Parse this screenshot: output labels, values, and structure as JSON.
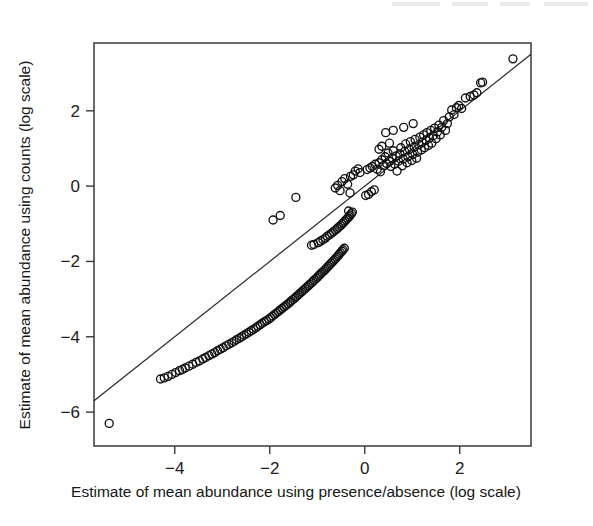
{
  "figure": {
    "background_color": "#ffffff",
    "ink_color": "#111111",
    "frame": {
      "left": 94,
      "top": 43,
      "right": 531,
      "bottom": 446
    }
  },
  "chart_data": {
    "type": "scatter",
    "title": "",
    "xlabel": "Estimate of mean abundance using presence/absence (log scale)",
    "ylabel": "Estimate of mean abundance using counts (log scale)",
    "xticks": [
      -4,
      -2,
      0,
      2
    ],
    "xtick_labels": [
      "-4",
      "-2",
      "0",
      "2"
    ],
    "yticks": [
      2,
      0,
      -2,
      -4,
      -6
    ],
    "ytick_labels": [
      "2",
      "0",
      "-2",
      "-4",
      "-6"
    ],
    "xlim": [
      -5.7,
      3.5
    ],
    "ylim": [
      -6.9,
      3.8
    ],
    "grid": false,
    "legend": null,
    "marker": {
      "shape": "open-circle",
      "radius": 4.0,
      "stroke_width": 1.35
    },
    "reference_line": {
      "name": "identity-line",
      "type": "straight",
      "slope": 1.0,
      "intercept": 0.0,
      "x_from": -5.7,
      "x_to": 3.5,
      "y_from": -5.7,
      "y_to": 3.5
    },
    "series": [
      {
        "name": "species",
        "n_points": 196,
        "points": [
          [
            -5.38,
            -6.3
          ],
          [
            -4.3,
            -5.12
          ],
          [
            -4.22,
            -5.09
          ],
          [
            -4.14,
            -5.05
          ],
          [
            -4.06,
            -5.0
          ],
          [
            -3.98,
            -4.95
          ],
          [
            -3.9,
            -4.9
          ],
          [
            -3.84,
            -4.87
          ],
          [
            -3.78,
            -4.83
          ],
          [
            -3.7,
            -4.78
          ],
          [
            -3.62,
            -4.73
          ],
          [
            -3.55,
            -4.68
          ],
          [
            -3.48,
            -4.64
          ],
          [
            -3.41,
            -4.59
          ],
          [
            -3.35,
            -4.55
          ],
          [
            -3.28,
            -4.5
          ],
          [
            -3.22,
            -4.46
          ],
          [
            -3.16,
            -4.42
          ],
          [
            -3.1,
            -4.37
          ],
          [
            -3.04,
            -4.33
          ],
          [
            -2.98,
            -4.29
          ],
          [
            -2.92,
            -4.24
          ],
          [
            -2.86,
            -4.2
          ],
          [
            -2.8,
            -4.16
          ],
          [
            -2.75,
            -4.12
          ],
          [
            -2.7,
            -4.08
          ],
          [
            -2.64,
            -4.04
          ],
          [
            -2.59,
            -4.0
          ],
          [
            -2.54,
            -3.96
          ],
          [
            -2.49,
            -3.92
          ],
          [
            -2.44,
            -3.88
          ],
          [
            -2.39,
            -3.84
          ],
          [
            -2.34,
            -3.8
          ],
          [
            -2.29,
            -3.76
          ],
          [
            -2.25,
            -3.72
          ],
          [
            -2.2,
            -3.68
          ],
          [
            -2.16,
            -3.64
          ],
          [
            -2.11,
            -3.6
          ],
          [
            -2.07,
            -3.57
          ],
          [
            -2.02,
            -3.53
          ],
          [
            -1.98,
            -3.49
          ],
          [
            -1.94,
            -3.45
          ],
          [
            -1.9,
            -3.41
          ],
          [
            -1.86,
            -3.37
          ],
          [
            -1.82,
            -3.33
          ],
          [
            -1.78,
            -3.29
          ],
          [
            -1.74,
            -3.25
          ],
          [
            -1.7,
            -3.21
          ],
          [
            -1.66,
            -3.17
          ],
          [
            -1.62,
            -3.13
          ],
          [
            -1.58,
            -3.09
          ],
          [
            -1.55,
            -3.05
          ],
          [
            -1.51,
            -3.01
          ],
          [
            -1.47,
            -2.97
          ],
          [
            -1.44,
            -2.93
          ],
          [
            -1.4,
            -2.89
          ],
          [
            -1.37,
            -2.85
          ],
          [
            -1.33,
            -2.81
          ],
          [
            -1.3,
            -2.77
          ],
          [
            -1.26,
            -2.73
          ],
          [
            -1.23,
            -2.69
          ],
          [
            -1.19,
            -2.65
          ],
          [
            -1.16,
            -2.61
          ],
          [
            -1.12,
            -2.57
          ],
          [
            -1.09,
            -2.53
          ],
          [
            -1.06,
            -2.49
          ],
          [
            -1.02,
            -2.45
          ],
          [
            -0.99,
            -2.41
          ],
          [
            -0.96,
            -2.37
          ],
          [
            -0.93,
            -2.33
          ],
          [
            -0.9,
            -2.29
          ],
          [
            -0.86,
            -2.25
          ],
          [
            -0.83,
            -2.21
          ],
          [
            -0.8,
            -2.17
          ],
          [
            -0.77,
            -2.13
          ],
          [
            -0.74,
            -2.09
          ],
          [
            -0.71,
            -2.05
          ],
          [
            -0.68,
            -2.01
          ],
          [
            -0.65,
            -1.97
          ],
          [
            -0.62,
            -1.93
          ],
          [
            -0.59,
            -1.89
          ],
          [
            -0.56,
            -1.85
          ],
          [
            -0.54,
            -1.81
          ],
          [
            -0.51,
            -1.77
          ],
          [
            -0.48,
            -1.73
          ],
          [
            -0.46,
            -1.69
          ],
          [
            -0.43,
            -1.65
          ],
          [
            -1.12,
            -1.57
          ],
          [
            -1.07,
            -1.55
          ],
          [
            -0.98,
            -1.5
          ],
          [
            -0.93,
            -1.46
          ],
          [
            -0.88,
            -1.42
          ],
          [
            -0.83,
            -1.38
          ],
          [
            -0.79,
            -1.33
          ],
          [
            -0.74,
            -1.29
          ],
          [
            -0.7,
            -1.25
          ],
          [
            -0.66,
            -1.21
          ],
          [
            -0.62,
            -1.17
          ],
          [
            -0.58,
            -1.13
          ],
          [
            -0.55,
            -1.09
          ],
          [
            -0.51,
            -1.05
          ],
          [
            -0.48,
            -1.01
          ],
          [
            -0.45,
            -0.97
          ],
          [
            -0.42,
            -0.93
          ],
          [
            -0.39,
            -0.89
          ],
          [
            -0.36,
            -0.85
          ],
          [
            -0.33,
            -0.81
          ],
          [
            -0.31,
            -0.77
          ],
          [
            -0.28,
            -0.73
          ],
          [
            -0.26,
            -0.69
          ],
          [
            -0.34,
            -0.66
          ],
          [
            -1.93,
            -0.9
          ],
          [
            -1.78,
            -0.78
          ],
          [
            -1.45,
            -0.3
          ],
          [
            -0.62,
            -0.05
          ],
          [
            -0.57,
            0.02
          ],
          [
            -0.52,
            -0.12
          ],
          [
            -0.48,
            0.12
          ],
          [
            -0.42,
            0.2
          ],
          [
            -0.36,
            0.05
          ],
          [
            -0.3,
            0.26
          ],
          [
            -0.24,
            0.3
          ],
          [
            -0.2,
            0.4
          ],
          [
            -0.14,
            0.46
          ],
          [
            -0.1,
            0.36
          ],
          [
            -0.31,
            -0.18
          ],
          [
            0.02,
            -0.25
          ],
          [
            0.08,
            -0.22
          ],
          [
            0.14,
            -0.15
          ],
          [
            0.2,
            -0.1
          ],
          [
            0.05,
            0.44
          ],
          [
            0.11,
            0.48
          ],
          [
            0.16,
            0.52
          ],
          [
            0.22,
            0.58
          ],
          [
            0.26,
            0.45
          ],
          [
            0.3,
            0.62
          ],
          [
            0.33,
            0.38
          ],
          [
            0.36,
            0.7
          ],
          [
            0.4,
            0.55
          ],
          [
            0.43,
            0.78
          ],
          [
            0.46,
            0.6
          ],
          [
            0.49,
            0.88
          ],
          [
            0.52,
            0.66
          ],
          [
            0.55,
            0.52
          ],
          [
            0.58,
            0.74
          ],
          [
            0.6,
            0.94
          ],
          [
            0.63,
            0.58
          ],
          [
            0.66,
            0.8
          ],
          [
            0.68,
            0.4
          ],
          [
            0.71,
            0.66
          ],
          [
            0.74,
            0.86
          ],
          [
            0.76,
            1.02
          ],
          [
            0.79,
            0.54
          ],
          [
            0.81,
            0.72
          ],
          [
            0.84,
            0.92
          ],
          [
            0.86,
            1.12
          ],
          [
            0.89,
            0.62
          ],
          [
            0.91,
            0.78
          ],
          [
            0.94,
            0.98
          ],
          [
            0.96,
            1.18
          ],
          [
            0.99,
            0.68
          ],
          [
            1.01,
            0.84
          ],
          [
            1.04,
            1.04
          ],
          [
            1.06,
            1.24
          ],
          [
            1.09,
            0.74
          ],
          [
            1.11,
            0.9
          ],
          [
            1.14,
            1.1
          ],
          [
            1.16,
            1.3
          ],
          [
            1.19,
            0.96
          ],
          [
            1.21,
            1.16
          ],
          [
            1.24,
            1.36
          ],
          [
            1.26,
            1.02
          ],
          [
            1.29,
            1.22
          ],
          [
            1.31,
            1.42
          ],
          [
            1.34,
            1.08
          ],
          [
            1.36,
            1.28
          ],
          [
            1.39,
            1.48
          ],
          [
            1.41,
            1.14
          ],
          [
            1.44,
            1.34
          ],
          [
            1.47,
            1.54
          ],
          [
            1.5,
            1.26
          ],
          [
            1.53,
            1.44
          ],
          [
            1.56,
            1.62
          ],
          [
            1.59,
            1.36
          ],
          [
            1.62,
            1.56
          ],
          [
            1.66,
            1.74
          ],
          [
            1.7,
            1.48
          ],
          [
            1.74,
            1.66
          ],
          [
            1.78,
            1.84
          ],
          [
            1.83,
            2.02
          ],
          [
            1.88,
            1.9
          ],
          [
            1.93,
            2.08
          ],
          [
            1.98,
            2.14
          ],
          [
            2.04,
            2.06
          ],
          [
            0.44,
            1.42
          ],
          [
            0.6,
            1.48
          ],
          [
            0.82,
            1.56
          ],
          [
            1.02,
            1.66
          ],
          [
            0.3,
            0.98
          ],
          [
            0.36,
            1.06
          ],
          [
            0.52,
            1.14
          ],
          [
            2.22,
            2.38
          ],
          [
            2.3,
            2.42
          ],
          [
            2.36,
            2.48
          ],
          [
            2.44,
            2.74
          ],
          [
            2.48,
            2.76
          ],
          [
            2.12,
            2.34
          ],
          [
            3.12,
            3.38
          ]
        ]
      }
    ]
  }
}
